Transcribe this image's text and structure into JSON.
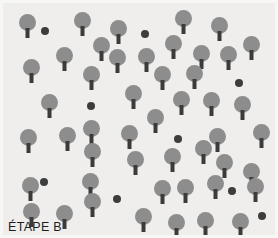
{
  "figure": {
    "caption": "ÉTAPE B",
    "width": 278,
    "height": 238,
    "colors": {
      "background": "#efeeec",
      "frame": "#f7f7f5",
      "canopy": "#8d8d8d",
      "trunk": "#3b3b3b",
      "dot": "#3d3d3d",
      "caption_text": "#1d1d1d"
    }
  },
  "chart_data": {
    "type": "scatter",
    "title": "ÉTAPE B",
    "xlabel": "",
    "ylabel": "",
    "xlim": [
      0,
      272
    ],
    "ylim": [
      0,
      232
    ],
    "grid": false,
    "legend": "none",
    "note": "Stand map of a forest plot. Large symbols are standing trees drawn as a gray circular canopy over a dark trunk; small dark filled circles are point markers (stumps/saplings).",
    "series": [
      {
        "name": "trees",
        "symbol": "tree",
        "count": 56,
        "canopy_diameter": 17,
        "trunk_width": 4,
        "trunk_height": 10,
        "points": [
          {
            "x": 24,
            "y": 11
          },
          {
            "x": 79,
            "y": 9
          },
          {
            "x": 115,
            "y": 17
          },
          {
            "x": 180,
            "y": 7
          },
          {
            "x": 216,
            "y": 14
          },
          {
            "x": 98,
            "y": 34
          },
          {
            "x": 170,
            "y": 32
          },
          {
            "x": 248,
            "y": 33
          },
          {
            "x": 61,
            "y": 44
          },
          {
            "x": 114,
            "y": 46
          },
          {
            "x": 143,
            "y": 45
          },
          {
            "x": 198,
            "y": 42
          },
          {
            "x": 225,
            "y": 43
          },
          {
            "x": 28,
            "y": 56
          },
          {
            "x": 88,
            "y": 63
          },
          {
            "x": 159,
            "y": 63
          },
          {
            "x": 191,
            "y": 62
          },
          {
            "x": 46,
            "y": 91
          },
          {
            "x": 130,
            "y": 82
          },
          {
            "x": 178,
            "y": 88
          },
          {
            "x": 208,
            "y": 89
          },
          {
            "x": 239,
            "y": 93
          },
          {
            "x": 152,
            "y": 106
          },
          {
            "x": 25,
            "y": 126
          },
          {
            "x": 64,
            "y": 124
          },
          {
            "x": 88,
            "y": 117
          },
          {
            "x": 126,
            "y": 122
          },
          {
            "x": 214,
            "y": 125
          },
          {
            "x": 258,
            "y": 121
          },
          {
            "x": 89,
            "y": 140
          },
          {
            "x": 132,
            "y": 148
          },
          {
            "x": 169,
            "y": 145
          },
          {
            "x": 200,
            "y": 137
          },
          {
            "x": 221,
            "y": 151
          },
          {
            "x": 248,
            "y": 160
          },
          {
            "x": 27,
            "y": 174
          },
          {
            "x": 87,
            "y": 170
          },
          {
            "x": 159,
            "y": 177
          },
          {
            "x": 182,
            "y": 176
          },
          {
            "x": 212,
            "y": 172
          },
          {
            "x": 252,
            "y": 175
          },
          {
            "x": 28,
            "y": 200
          },
          {
            "x": 61,
            "y": 202
          },
          {
            "x": 89,
            "y": 190
          },
          {
            "x": 140,
            "y": 205
          },
          {
            "x": 173,
            "y": 211
          },
          {
            "x": 202,
            "y": 209
          },
          {
            "x": 237,
            "y": 210
          }
        ]
      },
      {
        "name": "markers",
        "symbol": "dot",
        "count": 9,
        "diameter": 8,
        "points": [
          {
            "x": 42,
            "y": 28
          },
          {
            "x": 142,
            "y": 31
          },
          {
            "x": 236,
            "y": 80
          },
          {
            "x": 88,
            "y": 103
          },
          {
            "x": 175,
            "y": 136
          },
          {
            "x": 41,
            "y": 179
          },
          {
            "x": 114,
            "y": 196
          },
          {
            "x": 229,
            "y": 188
          },
          {
            "x": 259,
            "y": 213
          }
        ]
      }
    ]
  }
}
